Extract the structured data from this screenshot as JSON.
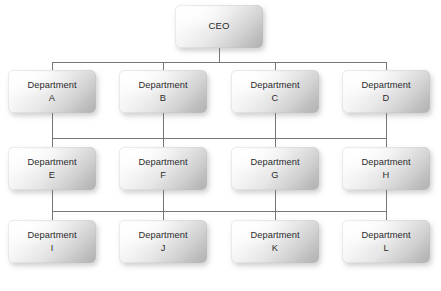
{
  "diagram": {
    "type": "org-chart",
    "background_color": "#ffffff",
    "connector_color": "#767676",
    "node_text_color": "#2b2b2b",
    "node_gradient_from": "#ffffff",
    "node_gradient_to": "#b0b0b0",
    "levels": [
      {
        "level": 0,
        "nodes": [
          {
            "id": "ceo",
            "label": "CEO",
            "x": 175,
            "y": 5,
            "w": 88,
            "h": 43
          }
        ]
      },
      {
        "level": 1,
        "nodes": [
          {
            "id": "dept-a",
            "label": "Department\nA",
            "x": 8,
            "y": 70,
            "w": 88,
            "h": 43
          },
          {
            "id": "dept-b",
            "label": "Department\nB",
            "x": 119,
            "y": 70,
            "w": 88,
            "h": 43
          },
          {
            "id": "dept-c",
            "label": "Department\nC",
            "x": 231,
            "y": 70,
            "w": 88,
            "h": 43
          },
          {
            "id": "dept-d",
            "label": "Department\nD",
            "x": 342,
            "y": 70,
            "w": 88,
            "h": 43
          }
        ]
      },
      {
        "level": 2,
        "nodes": [
          {
            "id": "dept-e",
            "label": "Department\nE",
            "x": 8,
            "y": 147,
            "w": 88,
            "h": 43
          },
          {
            "id": "dept-f",
            "label": "Department\nF",
            "x": 119,
            "y": 147,
            "w": 88,
            "h": 43
          },
          {
            "id": "dept-g",
            "label": "Department\nG",
            "x": 231,
            "y": 147,
            "w": 88,
            "h": 43
          },
          {
            "id": "dept-h",
            "label": "Department\nH",
            "x": 342,
            "y": 147,
            "w": 88,
            "h": 43
          }
        ]
      },
      {
        "level": 3,
        "nodes": [
          {
            "id": "dept-i",
            "label": "Department\nI",
            "x": 8,
            "y": 220,
            "w": 88,
            "h": 43
          },
          {
            "id": "dept-j",
            "label": "Department\nJ",
            "x": 119,
            "y": 220,
            "w": 88,
            "h": 43
          },
          {
            "id": "dept-k",
            "label": "Department\nK",
            "x": 231,
            "y": 220,
            "w": 88,
            "h": 43
          },
          {
            "id": "dept-l",
            "label": "Department\nL",
            "x": 342,
            "y": 220,
            "w": 88,
            "h": 43
          }
        ]
      }
    ],
    "connectors": {
      "ceo_stem": {
        "x": 219,
        "y": 48,
        "h": 14
      },
      "bus_1": {
        "x": 52,
        "y": 62,
        "w": 334
      },
      "bus_2": {
        "x": 52,
        "y": 138,
        "w": 334
      },
      "bus_3": {
        "x": 52,
        "y": 211,
        "w": 334
      },
      "drops_1": [
        {
          "x": 52,
          "y": 62,
          "h": 8
        },
        {
          "x": 163,
          "y": 62,
          "h": 8
        },
        {
          "x": 275,
          "y": 62,
          "h": 8
        },
        {
          "x": 386,
          "y": 62,
          "h": 8
        }
      ],
      "risers_2": [
        {
          "x": 52,
          "y": 113,
          "h": 25
        },
        {
          "x": 163,
          "y": 113,
          "h": 25
        },
        {
          "x": 275,
          "y": 113,
          "h": 25
        },
        {
          "x": 386,
          "y": 113,
          "h": 25
        }
      ],
      "drops_2": [
        {
          "x": 52,
          "y": 138,
          "h": 9
        },
        {
          "x": 163,
          "y": 138,
          "h": 9
        },
        {
          "x": 275,
          "y": 138,
          "h": 9
        },
        {
          "x": 386,
          "y": 138,
          "h": 9
        }
      ],
      "risers_3": [
        {
          "x": 52,
          "y": 190,
          "h": 21
        },
        {
          "x": 163,
          "y": 190,
          "h": 21
        },
        {
          "x": 275,
          "y": 190,
          "h": 21
        },
        {
          "x": 386,
          "y": 190,
          "h": 21
        }
      ],
      "drops_3": [
        {
          "x": 52,
          "y": 211,
          "h": 9
        },
        {
          "x": 163,
          "y": 211,
          "h": 9
        },
        {
          "x": 275,
          "y": 211,
          "h": 9
        },
        {
          "x": 386,
          "y": 211,
          "h": 9
        }
      ]
    }
  }
}
